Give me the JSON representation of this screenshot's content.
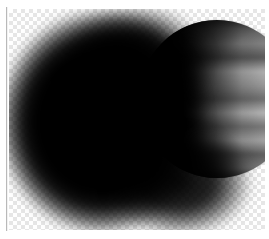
{
  "app": {
    "view": "image-canvas",
    "background_mode": "transparency-checkerboard"
  },
  "canvas": {
    "x": 9,
    "y": 9,
    "width": 256,
    "height": 221,
    "checker_size_px": 4,
    "checker_light": "#ffffff",
    "checker_dark": "#e6e6e6",
    "page_background": "#ffffff",
    "divider_color": "#b9b9b9"
  },
  "layers": [
    {
      "name": "planet",
      "kind": "raster-disc",
      "description": "Banded gas-giant planet disc with horizontal cloud belts; limb lit on the right, terminator toward the left",
      "center_x": 217,
      "center_y": 99,
      "radius_x": 78,
      "radius_y": 79,
      "band_colors": [
        "#2a2a2a",
        "#6e6e6e",
        "#8e8e8e",
        "#5c5c5c",
        "#b4b4b4",
        "#9a9a9a",
        "#6f6f6f",
        "#bcbcbc",
        "#7c7c7c",
        "#b2b2b2",
        "#696969",
        "#a6a6a6",
        "#4f4f4f"
      ],
      "lit_limb_side": "right",
      "highlight_color": "#bcbcbc",
      "shadow_color": "#000000"
    },
    {
      "name": "shadow-blob",
      "kind": "soft-brush-mask",
      "description": "Large soft-edged black blob (eclipse shadow / airbrush mask) covering most of the planet and extending past the canvas on the left and bottom",
      "center_x": 102,
      "center_y": 122,
      "radius_x": 108,
      "radius_y": 116,
      "fill": "#000000",
      "edge_blur_px": 5,
      "opacity": 1
    }
  ]
}
